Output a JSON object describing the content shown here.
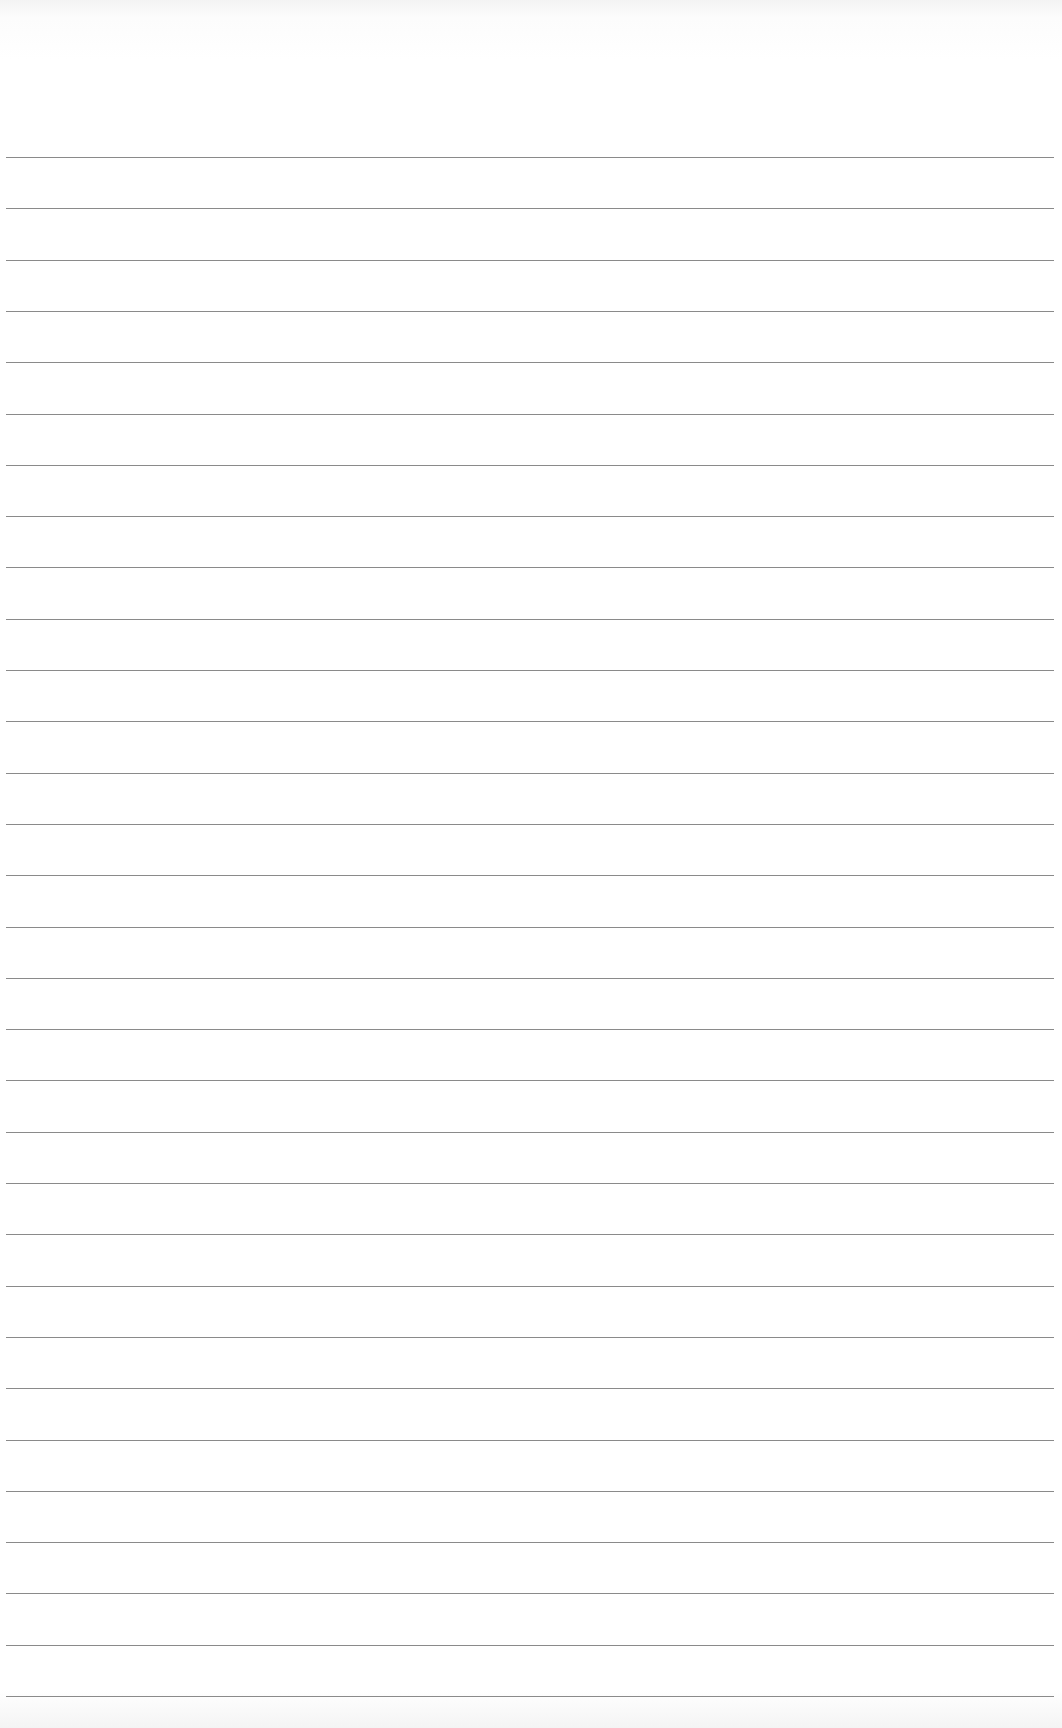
{
  "page": {
    "type": "blank ruled notebook paper",
    "background_color": "#ffffff",
    "rule_color": "#8a8a8a",
    "rule_count": 31,
    "first_rule_y": 157,
    "rule_spacing": 51.3
  }
}
